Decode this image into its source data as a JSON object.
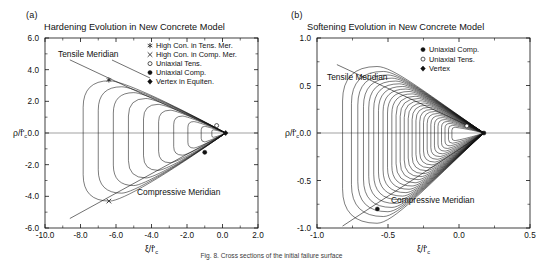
{
  "figure": {
    "caption": "Fig. 8. Cross sections of the initial failure surface",
    "panels": [
      {
        "letter": "(a)",
        "title": "Hardening Evolution in New Concrete Model",
        "xlabel": "ξ/f'",
        "xlabel_sub": "c",
        "ylabel": "ρ/f'",
        "ylabel_sub": "c",
        "annotations": [
          {
            "text": "Tensile Meridian"
          },
          {
            "text": "Compressive Meridian"
          }
        ],
        "legend": [
          {
            "marker": "asterisk",
            "label": "High Con. in Tens. Mer."
          },
          {
            "marker": "cross",
            "label": "High Con. in Comp. Mer."
          },
          {
            "marker": "open-circle",
            "label": "Uniaxial Tens."
          },
          {
            "marker": "filled-circle",
            "label": "Uniaxial Comp."
          },
          {
            "marker": "diamond",
            "label": "Vertex in Equiten."
          }
        ]
      },
      {
        "letter": "(b)",
        "title": "Softening Evolution in New Concrete Model",
        "xlabel": "ξ/f'",
        "xlabel_sub": "c",
        "ylabel": "ρ/f'",
        "ylabel_sub": "c",
        "annotations": [
          {
            "text": "Tensile Meridian"
          },
          {
            "text": "Compressive Meridian"
          }
        ],
        "legend": [
          {
            "marker": "filled-circle",
            "label": "Uniaxial Comp."
          },
          {
            "marker": "open-circle",
            "label": "Uniaxial Tens."
          },
          {
            "marker": "diamond",
            "label": "Vertex"
          }
        ]
      }
    ]
  },
  "chart_data": [
    {
      "type": "line",
      "title": "Hardening Evolution in New Concrete Model",
      "xlabel": "ξ/f'c",
      "ylabel": "ρ/f'c",
      "xlim": [
        -10.0,
        2.0
      ],
      "ylim": [
        -6.0,
        6.0
      ],
      "xticks": [
        -10.0,
        -8.0,
        -6.0,
        -4.0,
        -2.0,
        0.0,
        2.0
      ],
      "xticklabels": [
        "-10.0",
        "-8.0",
        "-6.0",
        "-4.0",
        "-2.0",
        "0.0",
        "2.0"
      ],
      "yticks": [
        -6.0,
        -4.0,
        -2.0,
        0.0,
        2.0,
        4.0,
        6.0
      ],
      "yticklabels": [
        "-6.0",
        "-4.0",
        "-2.0",
        "0.0",
        "2.0",
        "4.0",
        "6.0"
      ],
      "grid": false,
      "legend_position": "top-right",
      "series": [
        {
          "name": "loading surface 1",
          "apex_x": 0.18,
          "tail_x": -7.85,
          "tens_rho": 3.3,
          "comp_rho": -4.3
        },
        {
          "name": "loading surface 2",
          "apex_x": 0.18,
          "tail_x": -7.0,
          "tens_rho": 2.92,
          "comp_rho": -3.8
        },
        {
          "name": "loading surface 3",
          "apex_x": 0.18,
          "tail_x": -6.15,
          "tens_rho": 2.55,
          "comp_rho": -3.32
        },
        {
          "name": "loading surface 4",
          "apex_x": 0.18,
          "tail_x": -5.3,
          "tens_rho": 2.18,
          "comp_rho": -2.84
        },
        {
          "name": "loading surface 5",
          "apex_x": 0.18,
          "tail_x": -4.45,
          "tens_rho": 1.81,
          "comp_rho": -2.36
        },
        {
          "name": "loading surface 6",
          "apex_x": 0.18,
          "tail_x": -3.6,
          "tens_rho": 1.44,
          "comp_rho": -1.88
        },
        {
          "name": "loading surface 7",
          "apex_x": 0.18,
          "tail_x": -2.75,
          "tens_rho": 1.07,
          "comp_rho": -1.4
        },
        {
          "name": "loading surface 8",
          "apex_x": 0.18,
          "tail_x": -1.95,
          "tens_rho": 0.72,
          "comp_rho": -0.95
        },
        {
          "name": "loading surface 9",
          "apex_x": 0.18,
          "tail_x": -1.2,
          "tens_rho": 0.42,
          "comp_rho": -0.56
        },
        {
          "name": "loading surface 10",
          "apex_x": 0.18,
          "tail_x": -0.6,
          "tens_rho": 0.2,
          "comp_rho": -0.27
        }
      ],
      "markers": [
        {
          "name": "High Con. in Tens. Mer.",
          "x": -6.4,
          "y": 3.35,
          "style": "asterisk"
        },
        {
          "name": "High Con. in Comp. Mer.",
          "x": -6.4,
          "y": -4.3,
          "style": "cross"
        },
        {
          "name": "Uniaxial Tens.",
          "x": -0.33,
          "y": 0.47,
          "style": "open-circle"
        },
        {
          "name": "Uniaxial Comp.",
          "x": -1.0,
          "y": -1.22,
          "style": "filled-circle"
        },
        {
          "name": "Vertex in Equiten.",
          "x": 0.18,
          "y": 0.0,
          "style": "diamond"
        }
      ],
      "meridians": [
        {
          "name": "Tensile Meridian",
          "from": [
            -8.6,
            4.62
          ],
          "to": [
            0.18,
            0.0
          ]
        },
        {
          "name": "Compressive Meridian",
          "from": [
            -8.6,
            -5.4
          ],
          "to": [
            0.18,
            0.0
          ]
        }
      ]
    },
    {
      "type": "line",
      "title": "Softening Evolution in New Concrete Model",
      "xlabel": "ξ/f'c",
      "ylabel": "ρ/f'c",
      "xlim": [
        -1.0,
        0.5
      ],
      "ylim": [
        -1.0,
        1.0
      ],
      "xticks": [
        -1.0,
        -0.5,
        0.0,
        0.5
      ],
      "xticklabels": [
        "-1.0",
        "-0.5",
        "0.0",
        "0.5"
      ],
      "yticks": [
        -1.0,
        -0.5,
        0.0,
        0.5,
        1.0
      ],
      "yticklabels": [
        "-1.0",
        "-0.5",
        "0.0",
        "0.5",
        "1.0"
      ],
      "grid": false,
      "legend_position": "top-right",
      "series_count": 26,
      "series_note": "Family of contracting softening surfaces sharing the apex, sweeping from the initial failure surface toward the vertex.",
      "series": [
        {
          "name": "softening surface 1",
          "apex_x": 0.175,
          "tail_x": -0.82,
          "tens_rho": 0.7,
          "comp_rho": -0.95
        },
        {
          "name": "softening surface 13",
          "apex_x": 0.175,
          "tail_x": -0.42,
          "tens_rho": 0.36,
          "comp_rho": -0.49
        },
        {
          "name": "softening surface 26",
          "apex_x": 0.175,
          "tail_x": -0.05,
          "tens_rho": 0.06,
          "comp_rho": -0.08
        }
      ],
      "markers": [
        {
          "name": "Uniaxial Comp.",
          "x": -0.575,
          "y": -0.8,
          "style": "filled-circle"
        },
        {
          "name": "Uniaxial Tens.",
          "x": 0.055,
          "y": 0.075,
          "style": "open-circle"
        },
        {
          "name": "Vertex",
          "x": 0.175,
          "y": 0.0,
          "style": "filled-circle"
        }
      ],
      "meridians": [
        {
          "name": "Tensile Meridian",
          "from": [
            -0.86,
            0.72
          ],
          "to": [
            0.175,
            0.0
          ]
        },
        {
          "name": "Compressive Meridian",
          "from": [
            -0.82,
            -0.98
          ],
          "to": [
            0.175,
            0.0
          ]
        }
      ]
    }
  ]
}
